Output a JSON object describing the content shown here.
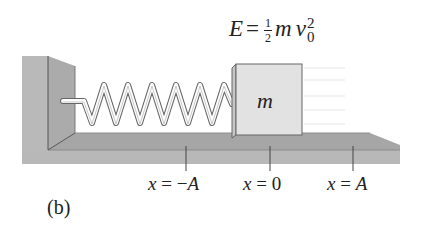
{
  "equation": {
    "lhs": "E",
    "equals": "=",
    "frac_num": "1",
    "frac_den": "2",
    "mass": "m",
    "velocity": "v",
    "superscript": "2",
    "subscript": "0"
  },
  "block": {
    "label": "m"
  },
  "positions": [
    {
      "label": "x = −A",
      "x": 186
    },
    {
      "label": "x = 0",
      "x": 270
    },
    {
      "label": "x = A",
      "x": 353
    }
  ],
  "panel_label": "(b)",
  "colors": {
    "wall_front": "#b9b9b9",
    "wall_side": "#a9a9a9",
    "floor_top": "#a4a4a4",
    "floor_front": "#b8b8b8",
    "block_face": "#e2e2e2",
    "spring": "#ffffff",
    "outline": "#555555"
  },
  "spring": {
    "coils": 6
  }
}
